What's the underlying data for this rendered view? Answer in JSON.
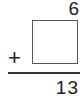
{
  "problem": {
    "operand_top": "6",
    "operator": "+",
    "operand_missing_value": "",
    "result": "13"
  }
}
